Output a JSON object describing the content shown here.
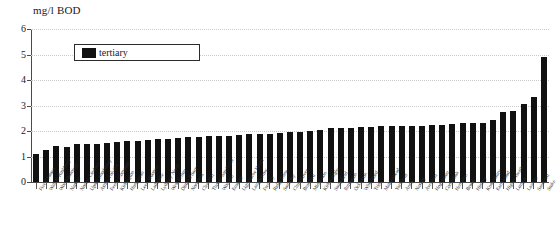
{
  "chart": {
    "title": "mg/l BOD",
    "legend": {
      "label": "tertiary",
      "position": "inside-top-left",
      "swatch_color": "#111111"
    }
  },
  "axes": {
    "y_ticks": [
      "6",
      "5",
      "4",
      "3",
      "2",
      "1",
      "0"
    ],
    "x_tick_glyph": "x-axis-tick"
  },
  "chart_data": {
    "type": "bar",
    "title": "mg/l BOD",
    "xlabel": "",
    "ylabel": "mg/l BOD",
    "ylim": [
      0,
      6
    ],
    "yticks": [
      0,
      1,
      2,
      3,
      4,
      5,
      6
    ],
    "grid": true,
    "legend": [
      "tertiary"
    ],
    "legend_position": "upper left inside plot",
    "bar_color": "#111111",
    "series": [
      {
        "name": "tertiary",
        "values": [
          1.1,
          1.25,
          1.4,
          1.38,
          1.5,
          1.5,
          1.5,
          1.52,
          1.55,
          1.6,
          1.62,
          1.65,
          1.7,
          1.7,
          1.72,
          1.75,
          1.78,
          1.8,
          1.8,
          1.82,
          1.85,
          1.88,
          1.9,
          1.9,
          1.92,
          1.95,
          1.98,
          2.0,
          2.05,
          2.1,
          2.1,
          2.12,
          2.15,
          2.15,
          2.18,
          2.2,
          2.2,
          2.2,
          2.2,
          2.22,
          2.25,
          2.28,
          2.3,
          2.3,
          2.32,
          2.45,
          2.75,
          2.78,
          3.05,
          3.35,
          4.9
        ]
      }
    ],
    "categories": [
      "Five Crosses",
      "Wall & Rushbury",
      "Woodsborough",
      "Napton",
      "Norton Lindsey",
      "Upton Snodsbury",
      "Ashby Folville",
      "Feeny Compton",
      "Kirkington",
      "Hungarton",
      "Leek Wootton",
      "Ladbroke",
      "Lydbury North",
      "West Felton",
      "Ditton Priors",
      "Northend",
      "Clee Hill",
      "Thorpe Satchville",
      "Wootton",
      "Enstone",
      "Lighthorne Heath",
      "Langberrow",
      "Frenshy",
      "Ridge Lane",
      "Somerby",
      "Churchover",
      "Bradford",
      "Middleton",
      "Kirk Langley",
      "Southfield",
      "Ilmington",
      "Ockbrook",
      "Whichford",
      "Trim",
      "Maidenhead",
      "Yarnfield",
      "Ansty",
      "Naseby",
      "Averham",
      "Hognaston",
      "Combrook",
      "Hempton",
      "Brook",
      "Himley",
      "Knowsbury",
      "Earlswood",
      "Higher Heath",
      "Longue",
      "Lawton",
      "Sandford",
      "Stoke"
    ]
  }
}
